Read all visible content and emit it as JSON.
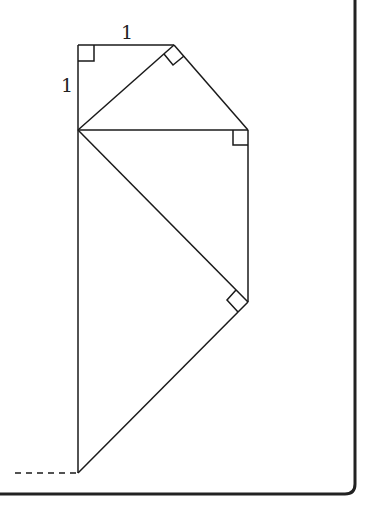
{
  "diagram": {
    "labels": {
      "top_edge": "1",
      "left_edge": "1"
    },
    "colors": {
      "stroke": "#1a1a1a",
      "border": "#222222",
      "background": "#ffffff"
    },
    "points": {
      "A": [
        78,
        45
      ],
      "B": [
        174,
        45
      ],
      "O": [
        78,
        130
      ],
      "C": [
        248,
        130
      ],
      "D": [
        248,
        302
      ],
      "E": [
        78,
        473
      ]
    }
  }
}
